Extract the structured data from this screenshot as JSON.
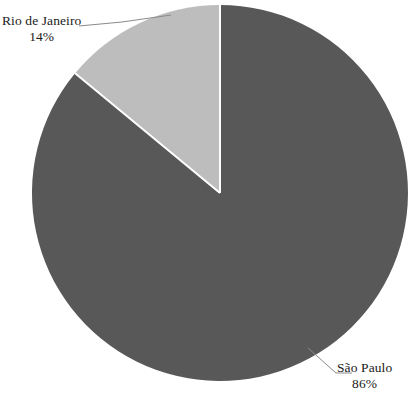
{
  "chart_data": {
    "type": "pie",
    "title": "",
    "subtitle": "",
    "xlabel": "",
    "ylabel": "",
    "grid": false,
    "legend_position": "none",
    "label_style": "callout-with-leader-line",
    "start_angle_deg": 0,
    "direction": "clockwise",
    "categories": [
      "São Paulo",
      "Rio de Janeiro"
    ],
    "values": [
      86,
      14
    ],
    "value_suffix": "%",
    "slices": [
      {
        "label": "São Paulo",
        "value": 86,
        "value_text": "86%",
        "color": "#585858",
        "start_angle_deg": 0,
        "end_angle_deg": 309.6,
        "callout_position": "bottom-right"
      },
      {
        "label": "Rio de Janeiro",
        "value": 14,
        "value_text": "14%",
        "color": "#bdbdbd",
        "start_angle_deg": 309.6,
        "end_angle_deg": 360,
        "callout_position": "top-left"
      }
    ],
    "colors": {
      "sao_paulo": "#585858",
      "rio_de_janeiro": "#bdbdbd",
      "background": "#ffffff",
      "separator": "#ffffff",
      "leader_line": "#8a8a8a",
      "text": "#1a1a1a"
    },
    "geometry": {
      "center_x": 220,
      "center_y": 193,
      "radius": 188
    }
  },
  "labels": {
    "rio": {
      "name": "Rio de Janeiro",
      "value": "14%"
    },
    "sao_paulo": {
      "name": "São Paulo",
      "value": "86%"
    }
  }
}
